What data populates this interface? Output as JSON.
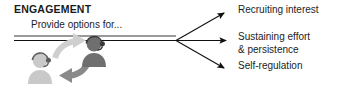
{
  "diagram": {
    "title": "ENGAGEMENT",
    "subtitle": "Provide options for...",
    "outcomes": [
      {
        "line1": "Recruiting interest",
        "line2": ""
      },
      {
        "line1": "Sustaining effort",
        "line2": "& persistence"
      },
      {
        "line1": "Self-regulation",
        "line2": ""
      }
    ],
    "icons": {
      "person_left": "person-headset-light-icon",
      "person_right": "person-headset-dark-icon",
      "arrow_upper": "curved-arrow-up-right-icon",
      "arrow_lower": "curved-arrow-down-left-icon",
      "branch": "three-way-arrow-fan-icon"
    },
    "colors": {
      "text": "#1d1d1d",
      "rule": "#9a9a9a",
      "arrow": "#111111",
      "person_light": "#c9c9c9",
      "person_dark": "#6f6f6f",
      "arrow_light": "#cfcfcf",
      "arrow_dark": "#8a8a8a",
      "background": "#ffffff"
    }
  }
}
